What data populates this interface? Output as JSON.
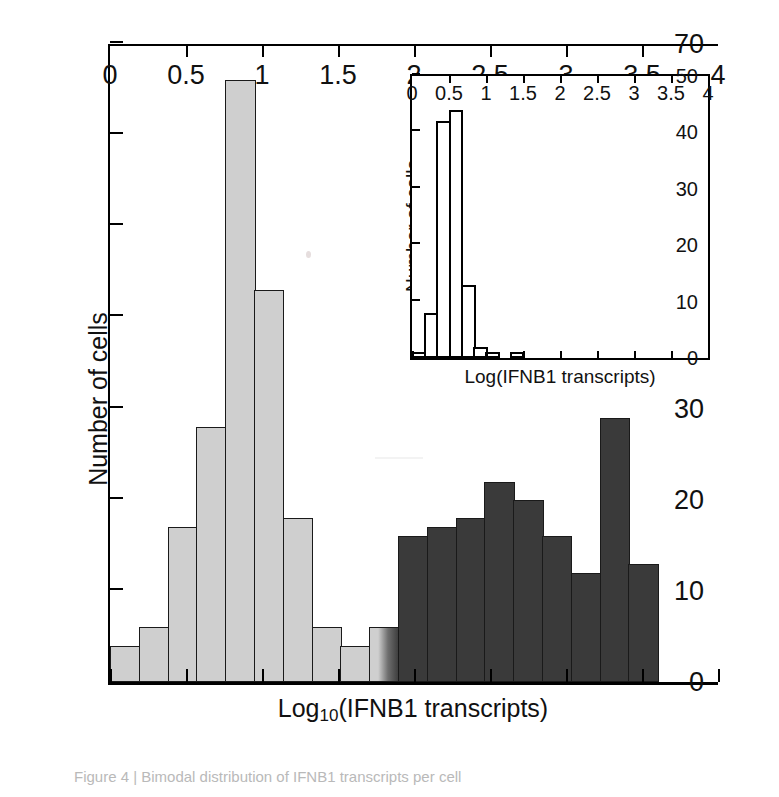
{
  "chart_data": [
    {
      "id": "main",
      "type": "bar",
      "title": "",
      "xlabel": "Log10(IFNB1 transcripts)",
      "xlabel_base": "Log",
      "xlabel_sub": "10",
      "xlabel_rest": "(IFNB1 transcripts)",
      "ylabel": "Number of cells",
      "xlim": [
        0,
        4
      ],
      "ylim": [
        0,
        70
      ],
      "xticks": [
        0,
        0.5,
        1,
        1.5,
        2,
        2.5,
        3,
        3.5,
        4
      ],
      "xtick_labels": [
        "0",
        "0.5",
        "1",
        "1.5",
        "2",
        "2.5",
        "3",
        "3.5",
        "4"
      ],
      "yticks": [
        0,
        10,
        20,
        30,
        40,
        50,
        60,
        70
      ],
      "ytick_labels": [
        "0",
        "10",
        "20",
        "30",
        "40",
        "50",
        "60",
        "70"
      ],
      "bin_width": 0.2,
      "grid": false,
      "legend": "none",
      "bins": [
        {
          "x0": 0.0,
          "x1": 0.2,
          "value": 4,
          "color": "#cfcfcf",
          "shade": "light"
        },
        {
          "x0": 0.2,
          "x1": 0.4,
          "value": 6,
          "color": "#cfcfcf",
          "shade": "light"
        },
        {
          "x0": 0.4,
          "x1": 0.6,
          "value": 17,
          "color": "#cfcfcf",
          "shade": "light"
        },
        {
          "x0": 0.6,
          "x1": 0.8,
          "value": 28,
          "color": "#cfcfcf",
          "shade": "light"
        },
        {
          "x0": 0.8,
          "x1": 1.0,
          "value": 66,
          "color": "#cfcfcf",
          "shade": "light"
        },
        {
          "x0": 1.0,
          "x1": 1.2,
          "value": 43,
          "color": "#cfcfcf",
          "shade": "light"
        },
        {
          "x0": 1.2,
          "x1": 1.4,
          "value": 18,
          "color": "#cfcfcf",
          "shade": "light"
        },
        {
          "x0": 1.4,
          "x1": 1.6,
          "value": 6,
          "color": "#cfcfcf",
          "shade": "light"
        },
        {
          "x0": 1.6,
          "x1": 1.8,
          "value": 4,
          "color": "#cfcfcf",
          "shade": "light"
        },
        {
          "x0": 1.8,
          "x1": 2.0,
          "value": 6,
          "color": "#cfcfcf",
          "shade": "grad"
        },
        {
          "x0": 2.0,
          "x1": 2.2,
          "value": 16,
          "color": "#3a3a3a",
          "shade": "dark"
        },
        {
          "x0": 2.2,
          "x1": 2.4,
          "value": 17,
          "color": "#3a3a3a",
          "shade": "dark"
        },
        {
          "x0": 2.4,
          "x1": 2.6,
          "value": 18,
          "color": "#3a3a3a",
          "shade": "dark"
        },
        {
          "x0": 2.6,
          "x1": 2.8,
          "value": 22,
          "color": "#3a3a3a",
          "shade": "dark"
        },
        {
          "x0": 2.8,
          "x1": 3.0,
          "value": 20,
          "color": "#3a3a3a",
          "shade": "dark"
        },
        {
          "x0": 3.0,
          "x1": 3.2,
          "value": 16,
          "color": "#3a3a3a",
          "shade": "dark"
        },
        {
          "x0": 3.2,
          "x1": 3.4,
          "value": 12,
          "color": "#3a3a3a",
          "shade": "dark"
        },
        {
          "x0": 3.4,
          "x1": 3.6,
          "value": 29,
          "color": "#3a3a3a",
          "shade": "dark"
        },
        {
          "x0": 3.6,
          "x1": 3.8,
          "value": 13,
          "color": "#3a3a3a",
          "shade": "dark"
        },
        {
          "x0": 3.8,
          "x1": 4.0,
          "value": 0,
          "color": "#ffffff",
          "shade": "none"
        }
      ]
    },
    {
      "id": "inset",
      "type": "bar",
      "title": "",
      "xlabel": "Log(IFNB1 transcripts)",
      "ylabel": "Number of cells",
      "xlim": [
        0,
        4
      ],
      "ylim": [
        0,
        50
      ],
      "xticks": [
        0,
        0.5,
        1,
        1.5,
        2,
        2.5,
        3,
        3.5,
        4
      ],
      "xtick_labels": [
        "0",
        "0.5",
        "1",
        "1.5",
        "2",
        "2.5",
        "3",
        "3.5",
        "4"
      ],
      "yticks": [
        0,
        10,
        20,
        30,
        40,
        50
      ],
      "ytick_labels": [
        "0",
        "10",
        "20",
        "30",
        "40",
        "50"
      ],
      "bin_width": 0.2,
      "grid": false,
      "legend": "none",
      "bins": [
        {
          "x0": 0.0,
          "x1": 0.2,
          "value": 1
        },
        {
          "x0": 0.2,
          "x1": 0.4,
          "value": 8
        },
        {
          "x0": 0.4,
          "x1": 0.6,
          "value": 42
        },
        {
          "x0": 0.6,
          "x1": 0.8,
          "value": 44
        },
        {
          "x0": 0.8,
          "x1": 1.0,
          "value": 13
        },
        {
          "x0": 1.0,
          "x1": 1.2,
          "value": 2
        },
        {
          "x0": 1.2,
          "x1": 1.4,
          "value": 1
        },
        {
          "x0": 1.4,
          "x1": 1.6,
          "value": 0
        },
        {
          "x0": 1.6,
          "x1": 1.8,
          "value": 1
        },
        {
          "x0": 1.8,
          "x1": 2.0,
          "value": 0
        },
        {
          "x0": 2.0,
          "x1": 2.2,
          "value": 0
        },
        {
          "x0": 2.2,
          "x1": 2.4,
          "value": 0
        },
        {
          "x0": 2.4,
          "x1": 2.6,
          "value": 0
        },
        {
          "x0": 2.6,
          "x1": 2.8,
          "value": 0
        },
        {
          "x0": 2.8,
          "x1": 3.0,
          "value": 0
        },
        {
          "x0": 3.0,
          "x1": 3.2,
          "value": 0
        },
        {
          "x0": 3.2,
          "x1": 3.4,
          "value": 0
        },
        {
          "x0": 3.4,
          "x1": 3.6,
          "value": 0
        },
        {
          "x0": 3.6,
          "x1": 3.8,
          "value": 0
        },
        {
          "x0": 3.8,
          "x1": 4.0,
          "value": 0
        }
      ]
    }
  ],
  "main": {
    "ylabel": "Number of cells",
    "xlabel_base": "Log",
    "xlabel_sub": "10",
    "xlabel_rest": "(IFNB1 transcripts)"
  },
  "inset": {
    "ylabel": "Number of cells",
    "xlabel": "Log(IFNB1 transcripts)"
  },
  "caption": {
    "text": "Figure 4 | Bimodal distribution of IFNB1 transcripts per cell"
  },
  "colors": {
    "light_bar": "#cfcfcf",
    "dark_bar": "#3a3a3a",
    "axis": "#000000",
    "background": "#ffffff"
  }
}
